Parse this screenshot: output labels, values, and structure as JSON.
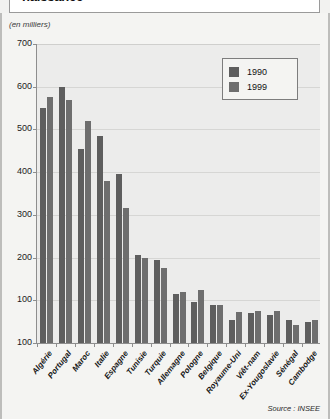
{
  "title": "naissance",
  "unit_label": "(en milliers)",
  "source": "Source : INSEE",
  "legend": {
    "items": [
      {
        "label": "1990",
        "color": "#5e5e5e"
      },
      {
        "label": "1999",
        "color": "#6e6e6e"
      }
    ]
  },
  "chart_data": {
    "type": "bar",
    "title": "naissance",
    "xlabel": "",
    "ylabel": "(en milliers)",
    "ylim": [
      0,
      700
    ],
    "yticks": [
      0,
      100,
      200,
      300,
      400,
      500,
      600,
      700
    ],
    "ytick_labels": [
      "100",
      "100",
      "200",
      "300",
      "400",
      "500",
      "600",
      "700"
    ],
    "grid": true,
    "legend_position": "top-right",
    "categories": [
      "Algérie",
      "Portugal",
      "Maroc",
      "Italie",
      "Espagne",
      "Tunisie",
      "Turquie",
      "Allemagne",
      "Pologne",
      "Belgique",
      "Royaume-Uni",
      "Viêt-nam",
      "Ex-Yougoslavie",
      "Sénégal",
      "Cambodge"
    ],
    "series": [
      {
        "name": "1990",
        "color": "#5e5e5e",
        "values": [
          550,
          600,
          455,
          485,
          395,
          205,
          195,
          115,
          95,
          90,
          55,
          70,
          65,
          55,
          50
        ]
      },
      {
        "name": "1999",
        "color": "#6e6e6e",
        "values": [
          575,
          570,
          520,
          380,
          315,
          200,
          175,
          120,
          125,
          90,
          72,
          75,
          75,
          43,
          53
        ]
      }
    ]
  }
}
